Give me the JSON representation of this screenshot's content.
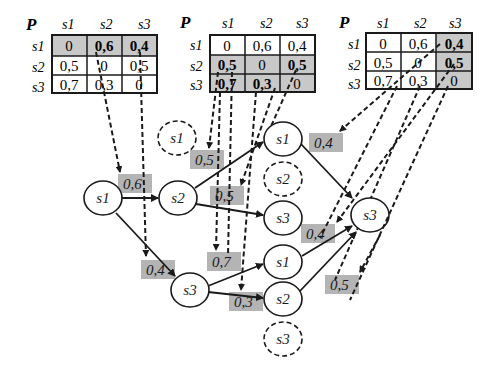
{
  "matrices": [
    {
      "label": "P",
      "col_headers": [
        "s1",
        "s2",
        "s3"
      ],
      "row_headers": [
        "s1",
        "s2",
        "s3"
      ],
      "cells": [
        [
          "0",
          "0,6",
          "0,4"
        ],
        [
          "0,5",
          "0",
          "0,5"
        ],
        [
          "0,7",
          "0,3",
          "0"
        ]
      ],
      "highlighted_rows": [
        0
      ],
      "highlighted_cols": [],
      "bold_cells": [
        [
          0,
          1
        ],
        [
          0,
          2
        ]
      ]
    },
    {
      "label": "P",
      "col_headers": [
        "s1",
        "s2",
        "s3"
      ],
      "row_headers": [
        "s1",
        "s2",
        "s3"
      ],
      "cells": [
        [
          "0",
          "0,6",
          "0,4"
        ],
        [
          "0,5",
          "0",
          "0,5"
        ],
        [
          "0,7",
          "0,3",
          "0"
        ]
      ],
      "highlighted_rows": [
        1,
        2
      ],
      "highlighted_cols": [],
      "bold_cells": [
        [
          1,
          0
        ],
        [
          1,
          2
        ],
        [
          2,
          0
        ],
        [
          2,
          1
        ]
      ]
    },
    {
      "label": "P",
      "col_headers": [
        "s1",
        "s2",
        "s3"
      ],
      "row_headers": [
        "s1",
        "s2",
        "s3"
      ],
      "cells": [
        [
          "0",
          "0,6",
          "0,4"
        ],
        [
          "0,5",
          "0",
          "0,5"
        ],
        [
          "0,7",
          "0,3",
          "0"
        ]
      ],
      "highlighted_rows": [],
      "highlighted_cols": [
        2
      ],
      "bold_cells": [
        [
          0,
          2
        ],
        [
          1,
          2
        ]
      ]
    }
  ],
  "nodes": [
    {
      "id": "n_s1_root",
      "label": "s1",
      "dashed": false
    },
    {
      "id": "n_s2_l1",
      "label": "s2",
      "dashed": false
    },
    {
      "id": "n_s3_l1",
      "label": "s3",
      "dashed": false
    },
    {
      "id": "n_s1_l1_ghost",
      "label": "s1",
      "dashed": true
    },
    {
      "id": "n_s1_a",
      "label": "s1",
      "dashed": false
    },
    {
      "id": "n_s2_a",
      "label": "s2",
      "dashed": true
    },
    {
      "id": "n_s3_a",
      "label": "s3",
      "dashed": false
    },
    {
      "id": "n_s1_b",
      "label": "s1",
      "dashed": false
    },
    {
      "id": "n_s2_b",
      "label": "s2",
      "dashed": false
    },
    {
      "id": "n_s3_b",
      "label": "s3",
      "dashed": true
    },
    {
      "id": "n_s3_final",
      "label": "s3",
      "dashed": false
    }
  ],
  "edge_labels": [
    "0,6",
    "0,4",
    "0,5",
    "0,5",
    "0,7",
    "0,3",
    "0,4",
    "0,4",
    "0,5"
  ],
  "colors": {
    "highlight": "#c8c8c8",
    "label_bg": "#b4b4b4",
    "stroke": "#1a1a1a"
  }
}
